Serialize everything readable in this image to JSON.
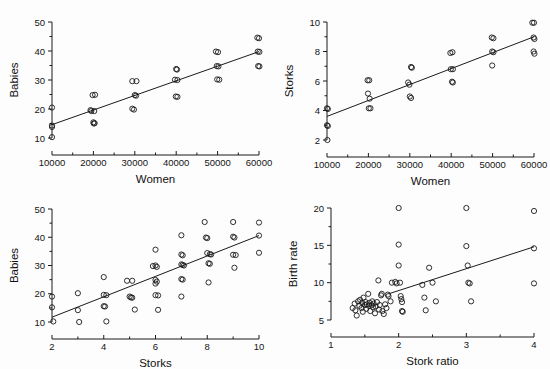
{
  "figure": {
    "background_color": "#fdfdfd",
    "ink_color": "#1a1a1a",
    "marker": "open-circle",
    "panel_count": 4
  },
  "chart_data": [
    {
      "type": "scatter",
      "panel": "top-left",
      "title": "",
      "xlabel": "Women",
      "ylabel": "Babies",
      "xlim": [
        10000,
        60000
      ],
      "ylim": [
        10,
        50
      ],
      "xticks": [
        10000,
        20000,
        30000,
        40000,
        50000,
        60000
      ],
      "xticklabels": [
        "10000",
        "20000",
        "30000",
        "40000",
        "50000",
        "60000"
      ],
      "yticks": [
        10,
        20,
        30,
        40,
        50
      ],
      "yticklabels": [
        "10",
        "20",
        "30",
        "40",
        "50"
      ],
      "grid": false,
      "legend": "none",
      "fit_line": {
        "x": [
          10000,
          60000
        ],
        "y": [
          14.6,
          39.8
        ]
      },
      "points": [
        [
          10000,
          20.5
        ],
        [
          10000,
          14.3
        ],
        [
          10000,
          13.8
        ],
        [
          10000,
          10.3
        ],
        [
          19300,
          19.6
        ],
        [
          19500,
          19.3
        ],
        [
          20200,
          19.3
        ],
        [
          19800,
          24.8
        ],
        [
          20400,
          24.9
        ],
        [
          20000,
          15.4
        ],
        [
          20300,
          15.1
        ],
        [
          20100,
          15.0
        ],
        [
          29400,
          29.6
        ],
        [
          30400,
          29.6
        ],
        [
          30000,
          24.8
        ],
        [
          30300,
          24.6
        ],
        [
          29400,
          20.1
        ],
        [
          29800,
          19.8
        ],
        [
          39700,
          30.1
        ],
        [
          40300,
          30.0
        ],
        [
          40000,
          33.8
        ],
        [
          40200,
          33.6
        ],
        [
          39900,
          24.3
        ],
        [
          40300,
          24.2
        ],
        [
          49600,
          39.8
        ],
        [
          50100,
          39.6
        ],
        [
          49800,
          34.8
        ],
        [
          50200,
          34.7
        ],
        [
          49900,
          30.2
        ],
        [
          50400,
          30.1
        ],
        [
          59600,
          44.6
        ],
        [
          60000,
          44.4
        ],
        [
          59700,
          39.8
        ],
        [
          60100,
          39.7
        ],
        [
          59800,
          34.8
        ],
        [
          60100,
          34.7
        ]
      ]
    },
    {
      "type": "scatter",
      "panel": "top-right",
      "title": "",
      "xlabel": "Women",
      "ylabel": "Storks",
      "xlim": [
        10000,
        60000
      ],
      "ylim": [
        2,
        10
      ],
      "xticks": [
        10000,
        20000,
        30000,
        40000,
        50000,
        60000
      ],
      "xticklabels": [
        "10000",
        "20000",
        "30000",
        "40000",
        "50000",
        "60000"
      ],
      "yticks": [
        2,
        4,
        6,
        8,
        10
      ],
      "yticklabels": [
        "2",
        "4",
        "6",
        "8",
        "10"
      ],
      "grid": false,
      "legend": "none",
      "fit_line": {
        "x": [
          10000,
          60000
        ],
        "y": [
          3.6,
          9.0
        ]
      },
      "points": [
        [
          10000,
          4.15
        ],
        [
          10200,
          4.1
        ],
        [
          10000,
          3.0
        ],
        [
          10200,
          2.95
        ],
        [
          10100,
          2.0
        ],
        [
          19800,
          6.05
        ],
        [
          20200,
          6.05
        ],
        [
          19900,
          5.15
        ],
        [
          20300,
          4.8
        ],
        [
          20100,
          4.15
        ],
        [
          20500,
          4.15
        ],
        [
          29600,
          5.9
        ],
        [
          29900,
          5.75
        ],
        [
          30300,
          6.95
        ],
        [
          30500,
          6.9
        ],
        [
          30000,
          4.95
        ],
        [
          30300,
          4.85
        ],
        [
          39800,
          7.9
        ],
        [
          40300,
          7.95
        ],
        [
          39900,
          6.8
        ],
        [
          40400,
          6.8
        ],
        [
          40200,
          5.95
        ],
        [
          40400,
          5.9
        ],
        [
          49800,
          8.95
        ],
        [
          50200,
          8.9
        ],
        [
          49900,
          8.0
        ],
        [
          50200,
          7.95
        ],
        [
          49900,
          7.05
        ],
        [
          59600,
          9.95
        ],
        [
          60000,
          9.95
        ],
        [
          59900,
          8.95
        ],
        [
          60100,
          8.85
        ],
        [
          59900,
          8.0
        ],
        [
          60100,
          7.85
        ]
      ]
    },
    {
      "type": "scatter",
      "panel": "bottom-left",
      "title": "",
      "xlabel": "Storks",
      "ylabel": "Babies",
      "xlim": [
        2,
        10
      ],
      "ylim": [
        10,
        50
      ],
      "xticks": [
        2,
        4,
        6,
        8,
        10
      ],
      "xticklabels": [
        "2",
        "4",
        "6",
        "8",
        "10"
      ],
      "yticks": [
        10,
        20,
        30,
        40,
        50
      ],
      "yticklabels": [
        "10",
        "20",
        "30",
        "40",
        "50"
      ],
      "grid": false,
      "legend": "none",
      "fit_line": {
        "x": [
          2,
          10
        ],
        "y": [
          11.7,
          40.6
        ]
      },
      "points": [
        [
          2.0,
          19.0
        ],
        [
          2.0,
          15.2
        ],
        [
          2.05,
          10.2
        ],
        [
          3.0,
          20.2
        ],
        [
          3.0,
          14.2
        ],
        [
          3.05,
          10.0
        ],
        [
          4.0,
          25.9
        ],
        [
          4.0,
          19.6
        ],
        [
          4.1,
          19.5
        ],
        [
          4.0,
          15.6
        ],
        [
          4.05,
          15.5
        ],
        [
          4.1,
          10.2
        ],
        [
          4.9,
          24.6
        ],
        [
          5.1,
          24.6
        ],
        [
          5.0,
          19.0
        ],
        [
          5.05,
          18.7
        ],
        [
          5.1,
          18.6
        ],
        [
          5.2,
          14.4
        ],
        [
          5.9,
          29.8
        ],
        [
          6.0,
          30.0
        ],
        [
          6.05,
          29.5
        ],
        [
          6.0,
          35.6
        ],
        [
          6.0,
          24.9
        ],
        [
          6.05,
          24.3
        ],
        [
          6.0,
          23.6
        ],
        [
          6.0,
          19.5
        ],
        [
          6.1,
          19.4
        ],
        [
          6.1,
          14.3
        ],
        [
          7.0,
          40.7
        ],
        [
          7.0,
          33.9
        ],
        [
          7.05,
          33.6
        ],
        [
          7.0,
          30.4
        ],
        [
          7.05,
          30.2
        ],
        [
          7.1,
          30.0
        ],
        [
          7.0,
          25.2
        ],
        [
          7.05,
          25.0
        ],
        [
          7.0,
          19.0
        ],
        [
          7.9,
          45.4
        ],
        [
          7.95,
          39.9
        ],
        [
          8.0,
          39.7
        ],
        [
          8.0,
          34.4
        ],
        [
          8.1,
          34.0
        ],
        [
          8.15,
          33.9
        ],
        [
          8.05,
          30.8
        ],
        [
          8.1,
          30.6
        ],
        [
          8.05,
          24.0
        ],
        [
          9.0,
          45.4
        ],
        [
          9.0,
          40.2
        ],
        [
          9.05,
          39.9
        ],
        [
          9.0,
          33.8
        ],
        [
          9.1,
          33.7
        ],
        [
          9.05,
          29.2
        ],
        [
          10.0,
          45.2
        ],
        [
          10.0,
          40.6
        ],
        [
          10.0,
          34.5
        ]
      ]
    },
    {
      "type": "scatter",
      "panel": "bottom-right",
      "title": "",
      "xlabel": "Stork ratio",
      "ylabel": "Birth rate",
      "xlim": [
        1,
        4
      ],
      "ylim": [
        5,
        20
      ],
      "xticks": [
        1,
        2,
        3,
        4
      ],
      "xticklabels": [
        "1",
        "2",
        "3",
        "4"
      ],
      "yticks": [
        5,
        10,
        15,
        20
      ],
      "yticklabels": [
        "5",
        "10",
        "15",
        "20"
      ],
      "grid": false,
      "legend": "none",
      "fit_line": {
        "x": [
          1.85,
          4.0
        ],
        "y": [
          8.5,
          14.8
        ]
      },
      "points": [
        [
          1.32,
          6.6
        ],
        [
          1.35,
          7.2
        ],
        [
          1.36,
          6.3
        ],
        [
          1.38,
          5.6
        ],
        [
          1.4,
          7.5
        ],
        [
          1.42,
          6.9
        ],
        [
          1.43,
          7.7
        ],
        [
          1.45,
          6.6
        ],
        [
          1.46,
          7.3
        ],
        [
          1.47,
          6.1
        ],
        [
          1.48,
          8.0
        ],
        [
          1.5,
          7.0
        ],
        [
          1.51,
          7.4
        ],
        [
          1.52,
          6.5
        ],
        [
          1.53,
          7.1
        ],
        [
          1.55,
          8.5
        ],
        [
          1.56,
          6.9
        ],
        [
          1.57,
          7.3
        ],
        [
          1.58,
          6.2
        ],
        [
          1.6,
          7.0
        ],
        [
          1.61,
          7.5
        ],
        [
          1.62,
          6.7
        ],
        [
          1.63,
          7.2
        ],
        [
          1.65,
          5.9
        ],
        [
          1.66,
          6.8
        ],
        [
          1.68,
          7.4
        ],
        [
          1.7,
          10.3
        ],
        [
          1.71,
          6.4
        ],
        [
          1.72,
          7.0
        ],
        [
          1.74,
          8.3
        ],
        [
          1.75,
          8.5
        ],
        [
          1.76,
          6.2
        ],
        [
          1.78,
          5.8
        ],
        [
          1.8,
          7.1
        ],
        [
          1.82,
          6.6
        ],
        [
          1.84,
          8.4
        ],
        [
          1.85,
          8.2
        ],
        [
          1.88,
          7.5
        ],
        [
          1.9,
          10.0
        ],
        [
          1.95,
          10.1
        ],
        [
          1.97,
          9.9
        ],
        [
          2.0,
          20.0
        ],
        [
          2.0,
          15.1
        ],
        [
          2.0,
          12.3
        ],
        [
          2.02,
          10.0
        ],
        [
          2.03,
          8.2
        ],
        [
          2.04,
          7.8
        ],
        [
          2.05,
          7.4
        ],
        [
          2.05,
          6.2
        ],
        [
          2.06,
          6.1
        ],
        [
          2.35,
          9.7
        ],
        [
          2.38,
          8.0
        ],
        [
          2.4,
          6.3
        ],
        [
          2.45,
          12.0
        ],
        [
          2.5,
          10.0
        ],
        [
          2.55,
          7.5
        ],
        [
          3.0,
          20.0
        ],
        [
          3.0,
          14.9
        ],
        [
          3.02,
          12.3
        ],
        [
          3.03,
          10.0
        ],
        [
          3.05,
          9.9
        ],
        [
          3.07,
          7.5
        ],
        [
          4.0,
          19.6
        ],
        [
          4.0,
          14.6
        ],
        [
          4.0,
          9.9
        ]
      ]
    }
  ]
}
